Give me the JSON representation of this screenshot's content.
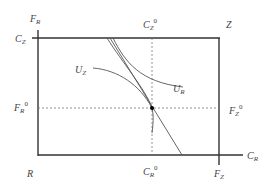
{
  "diagram": {
    "type": "edgeworth-box",
    "labels": {
      "F_R_axis": {
        "base": "F",
        "sub": "R",
        "sup": ""
      },
      "C_Z_axis": {
        "base": "C",
        "sub": "Z",
        "sup": ""
      },
      "C_Z_0": {
        "base": "C",
        "sub": "Z",
        "sup": "0"
      },
      "Z_origin": {
        "base": "Z",
        "sub": "",
        "sup": ""
      },
      "U_Z_curve": {
        "base": "U",
        "sub": "Z",
        "sup": ""
      },
      "U_R_curve": {
        "base": "U",
        "sub": "R",
        "sup": ""
      },
      "F_R_0": {
        "base": "F",
        "sub": "R",
        "sup": "0"
      },
      "F_Z_0": {
        "base": "F",
        "sub": "Z",
        "sup": "0"
      },
      "R_origin": {
        "base": "R",
        "sub": "",
        "sup": ""
      },
      "C_R_0": {
        "base": "C",
        "sub": "R",
        "sup": "0"
      },
      "F_Z_axis": {
        "base": "F",
        "sub": "Z",
        "sup": ""
      },
      "C_R_axis": {
        "base": "C",
        "sub": "R",
        "sup": ""
      }
    },
    "colors": {
      "line": "#333333",
      "curve": "#555555",
      "dashed": "#777777",
      "point": "#000000"
    }
  }
}
